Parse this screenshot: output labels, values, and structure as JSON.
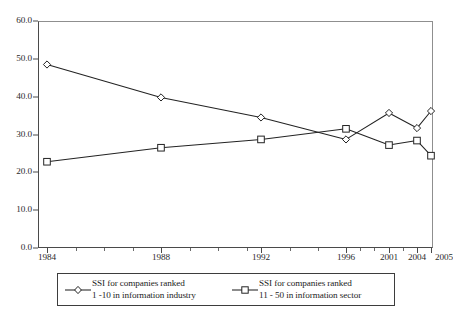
{
  "chart_data": {
    "type": "line",
    "title": "",
    "subtitle": "",
    "xlabel": "",
    "ylabel": "",
    "x": [
      "1984",
      "1988",
      "1992",
      "1996",
      "2001",
      "2004",
      "2005"
    ],
    "categories": [
      "1984",
      "1988",
      "1992",
      "1996",
      "2001",
      "2004",
      "2005"
    ],
    "series": [
      {
        "name": "SSI for companies ranked 1 -10 in information industry",
        "marker": "diamond",
        "values": [
          48.5,
          39.8,
          34.5,
          28.7,
          35.7,
          31.7,
          36.2
        ]
      },
      {
        "name": "SSI for companies ranked 11 - 50 in information sector",
        "marker": "square",
        "values": [
          22.8,
          26.5,
          28.7,
          31.5,
          27.2,
          28.4,
          24.4
        ]
      }
    ],
    "ylim": [
      0.0,
      60.0
    ],
    "ytick_values": [
      0.0,
      10.0,
      20.0,
      30.0,
      40.0,
      50.0,
      60.0
    ],
    "ytick_labels": [
      "0.0",
      "10.0",
      "20.0",
      "30.0",
      "40.0",
      "50.0",
      "60.0"
    ],
    "xtick_labels": [
      "1984",
      "1988",
      "1992",
      "1996",
      "2001",
      "2004",
      "2005"
    ],
    "grid": false,
    "legend_position": "bottom",
    "line_color": "#232323",
    "marker_fill": "#ffffff",
    "axis_color": "#4a4a4a",
    "background": "#ffffff"
  },
  "legend": {
    "entries": [
      {
        "marker": "diamond-marker",
        "line1": "SSI for companies ranked",
        "line2": "1 -10 in information industry"
      },
      {
        "marker": "square-marker",
        "line1": "SSI for companies ranked",
        "line2": "11 - 50 in information sector"
      }
    ]
  }
}
